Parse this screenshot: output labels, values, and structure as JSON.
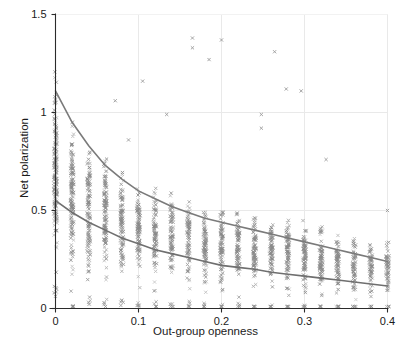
{
  "chart_data": {
    "type": "scatter",
    "title": "",
    "xlabel": "Out-group openness",
    "ylabel": "Net polarization",
    "xlim": [
      0,
      0.4
    ],
    "ylim": [
      0,
      1.5
    ],
    "xticks": [
      "0",
      "0.1",
      "0.2",
      "0.3",
      "0.4"
    ],
    "xtick_values": [
      0,
      0.1,
      0.2,
      0.3,
      0.4
    ],
    "yticks": [
      "0",
      "0.5",
      "1",
      "1.5"
    ],
    "ytick_values": [
      0,
      0.5,
      1,
      1.5
    ],
    "grid": true,
    "grid_color": "#e9e9e9",
    "legend": "none",
    "marker": "x",
    "marker_color": "#8a8a8a",
    "marker_size": 3.2,
    "series": [
      {
        "name": "Net polarization vs out-group openness",
        "description": "Dense vertical bands of observations at discrete out-group openness values spaced about 0.02 apart; polarization spread shrinks and shifts downward as openness increases.",
        "columns": [
          {
            "x": 0.0,
            "y_min": 0.12,
            "y_max": 1.29,
            "density": 1.0
          },
          {
            "x": 0.02,
            "y_min": 0.03,
            "y_max": 1.06,
            "density": 0.95
          },
          {
            "x": 0.04,
            "y_min": 0.06,
            "y_max": 0.92,
            "density": 0.9
          },
          {
            "x": 0.06,
            "y_min": 0.05,
            "y_max": 0.88,
            "density": 0.88
          },
          {
            "x": 0.08,
            "y_min": 0.05,
            "y_max": 0.78,
            "density": 0.86
          },
          {
            "x": 0.1,
            "y_min": 0.04,
            "y_max": 0.74,
            "density": 0.84
          },
          {
            "x": 0.12,
            "y_min": 0.04,
            "y_max": 0.68,
            "density": 0.8
          },
          {
            "x": 0.14,
            "y_min": 0.04,
            "y_max": 0.64,
            "density": 0.8
          },
          {
            "x": 0.16,
            "y_min": 0.04,
            "y_max": 0.62,
            "density": 0.8
          },
          {
            "x": 0.18,
            "y_min": 0.03,
            "y_max": 0.6,
            "density": 0.82
          },
          {
            "x": 0.2,
            "y_min": 0.03,
            "y_max": 0.58,
            "density": 0.86
          },
          {
            "x": 0.22,
            "y_min": 0.03,
            "y_max": 0.55,
            "density": 0.88
          },
          {
            "x": 0.24,
            "y_min": 0.02,
            "y_max": 0.54,
            "density": 0.9
          },
          {
            "x": 0.26,
            "y_min": 0.02,
            "y_max": 0.52,
            "density": 0.9
          },
          {
            "x": 0.28,
            "y_min": 0.02,
            "y_max": 0.51,
            "density": 0.9
          },
          {
            "x": 0.3,
            "y_min": 0.02,
            "y_max": 0.49,
            "density": 0.9
          },
          {
            "x": 0.32,
            "y_min": 0.02,
            "y_max": 0.48,
            "density": 0.88
          },
          {
            "x": 0.34,
            "y_min": 0.02,
            "y_max": 0.44,
            "density": 0.86
          },
          {
            "x": 0.36,
            "y_min": 0.02,
            "y_max": 0.4,
            "density": 0.8
          },
          {
            "x": 0.38,
            "y_min": 0.02,
            "y_max": 0.38,
            "density": 0.78
          },
          {
            "x": 0.4,
            "y_min": 0.02,
            "y_max": 0.37,
            "density": 0.7
          }
        ],
        "outliers": [
          {
            "x": 0.105,
            "y": 1.16
          },
          {
            "x": 0.165,
            "y": 1.38
          },
          {
            "x": 0.165,
            "y": 1.33
          },
          {
            "x": 0.2,
            "y": 1.37
          },
          {
            "x": 0.185,
            "y": 1.27
          },
          {
            "x": 0.264,
            "y": 1.31
          },
          {
            "x": 0.278,
            "y": 1.12
          },
          {
            "x": 0.296,
            "y": 1.11
          },
          {
            "x": 0.248,
            "y": 0.99
          },
          {
            "x": 0.248,
            "y": 0.92
          },
          {
            "x": 0.134,
            "y": 0.99
          },
          {
            "x": 0.072,
            "y": 1.06
          },
          {
            "x": 0.088,
            "y": 0.86
          },
          {
            "x": 0.326,
            "y": 0.76
          },
          {
            "x": 0.4,
            "y": 0.5
          }
        ]
      }
    ],
    "fitted_curves": [
      {
        "name": "upper-fit",
        "color": "#7a7a7a",
        "width": 1.6,
        "points": [
          {
            "x": 0.0,
            "y": 1.11
          },
          {
            "x": 0.02,
            "y": 0.95
          },
          {
            "x": 0.04,
            "y": 0.83
          },
          {
            "x": 0.06,
            "y": 0.73
          },
          {
            "x": 0.08,
            "y": 0.66
          },
          {
            "x": 0.1,
            "y": 0.6
          },
          {
            "x": 0.12,
            "y": 0.56
          },
          {
            "x": 0.14,
            "y": 0.52
          },
          {
            "x": 0.16,
            "y": 0.49
          },
          {
            "x": 0.18,
            "y": 0.46
          },
          {
            "x": 0.2,
            "y": 0.44
          },
          {
            "x": 0.22,
            "y": 0.42
          },
          {
            "x": 0.24,
            "y": 0.4
          },
          {
            "x": 0.26,
            "y": 0.38
          },
          {
            "x": 0.28,
            "y": 0.36
          },
          {
            "x": 0.3,
            "y": 0.34
          },
          {
            "x": 0.32,
            "y": 0.32
          },
          {
            "x": 0.34,
            "y": 0.3
          },
          {
            "x": 0.36,
            "y": 0.28
          },
          {
            "x": 0.38,
            "y": 0.26
          },
          {
            "x": 0.4,
            "y": 0.24
          }
        ]
      },
      {
        "name": "lower-fit",
        "color": "#6f6f6f",
        "width": 1.6,
        "points": [
          {
            "x": 0.0,
            "y": 0.55
          },
          {
            "x": 0.02,
            "y": 0.49
          },
          {
            "x": 0.04,
            "y": 0.44
          },
          {
            "x": 0.06,
            "y": 0.4
          },
          {
            "x": 0.08,
            "y": 0.36
          },
          {
            "x": 0.1,
            "y": 0.33
          },
          {
            "x": 0.12,
            "y": 0.3
          },
          {
            "x": 0.14,
            "y": 0.28
          },
          {
            "x": 0.16,
            "y": 0.26
          },
          {
            "x": 0.18,
            "y": 0.24
          },
          {
            "x": 0.2,
            "y": 0.22
          },
          {
            "x": 0.22,
            "y": 0.21
          },
          {
            "x": 0.24,
            "y": 0.2
          },
          {
            "x": 0.26,
            "y": 0.185
          },
          {
            "x": 0.28,
            "y": 0.175
          },
          {
            "x": 0.3,
            "y": 0.165
          },
          {
            "x": 0.32,
            "y": 0.155
          },
          {
            "x": 0.34,
            "y": 0.145
          },
          {
            "x": 0.36,
            "y": 0.135
          },
          {
            "x": 0.38,
            "y": 0.125
          },
          {
            "x": 0.4,
            "y": 0.115
          }
        ]
      }
    ]
  }
}
